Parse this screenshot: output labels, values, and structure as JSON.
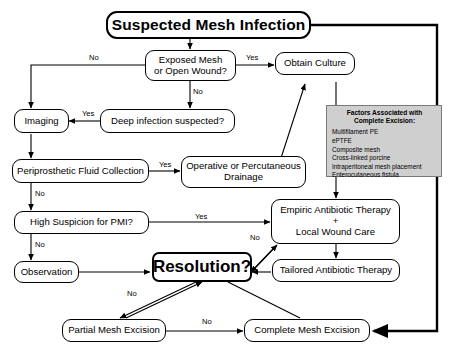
{
  "diagram": {
    "title": "Suspected Mesh Infection",
    "nodes": {
      "title": "Suspected Mesh Infection",
      "exposed": "Exposed Mesh\nor Open Wound?",
      "exposed_l1": "Exposed Mesh",
      "exposed_l2": "or Open Wound?",
      "culture": "Obtain Culture",
      "imaging": "Imaging",
      "deep": "Deep infection suspected?",
      "fluid": "Periprosthetic Fluid Collection",
      "drainage_l1": "Operative or Percutaneous",
      "drainage_l2": "Drainage",
      "pmi": "High Suspicion for PMI?",
      "empiric_l1": "Empiric Antibiotic Therapy",
      "empiric_l2": "+",
      "empiric_l3": "Local Wound Care",
      "observation": "Observation",
      "resolution": "Resolution?",
      "tailored": "Tailored Antibiotic Therapy",
      "partial": "Partial Mesh Excision",
      "complete": "Complete Mesh Excision"
    },
    "edge_labels": {
      "no_exposed_left": "No",
      "yes_exposed_right": "Yes",
      "no_exposed_down": "No",
      "yes_deep": "Yes",
      "yes_fluid": "Yes",
      "no_fluid": "No",
      "yes_pmi": "Yes",
      "no_pmi": "No",
      "no_resolution_empiric": "No",
      "no_resolution_partial": "No",
      "no_partial_complete": "No"
    },
    "factors_box": {
      "heading_line1": "Factors Associated with",
      "heading_line2": "Complete Excision:",
      "items": [
        "Multifilament PE",
        "ePTFE",
        "Composite mesh",
        "Cross-linked porcine",
        "Intraperitoneal mesh placement",
        "Enterocutaneous fistula"
      ]
    },
    "colors": {
      "background": "#ffffff",
      "stroke": "#000000",
      "factors_fill": "#cfcfcf",
      "factors_border": "#7a7a7a"
    }
  }
}
